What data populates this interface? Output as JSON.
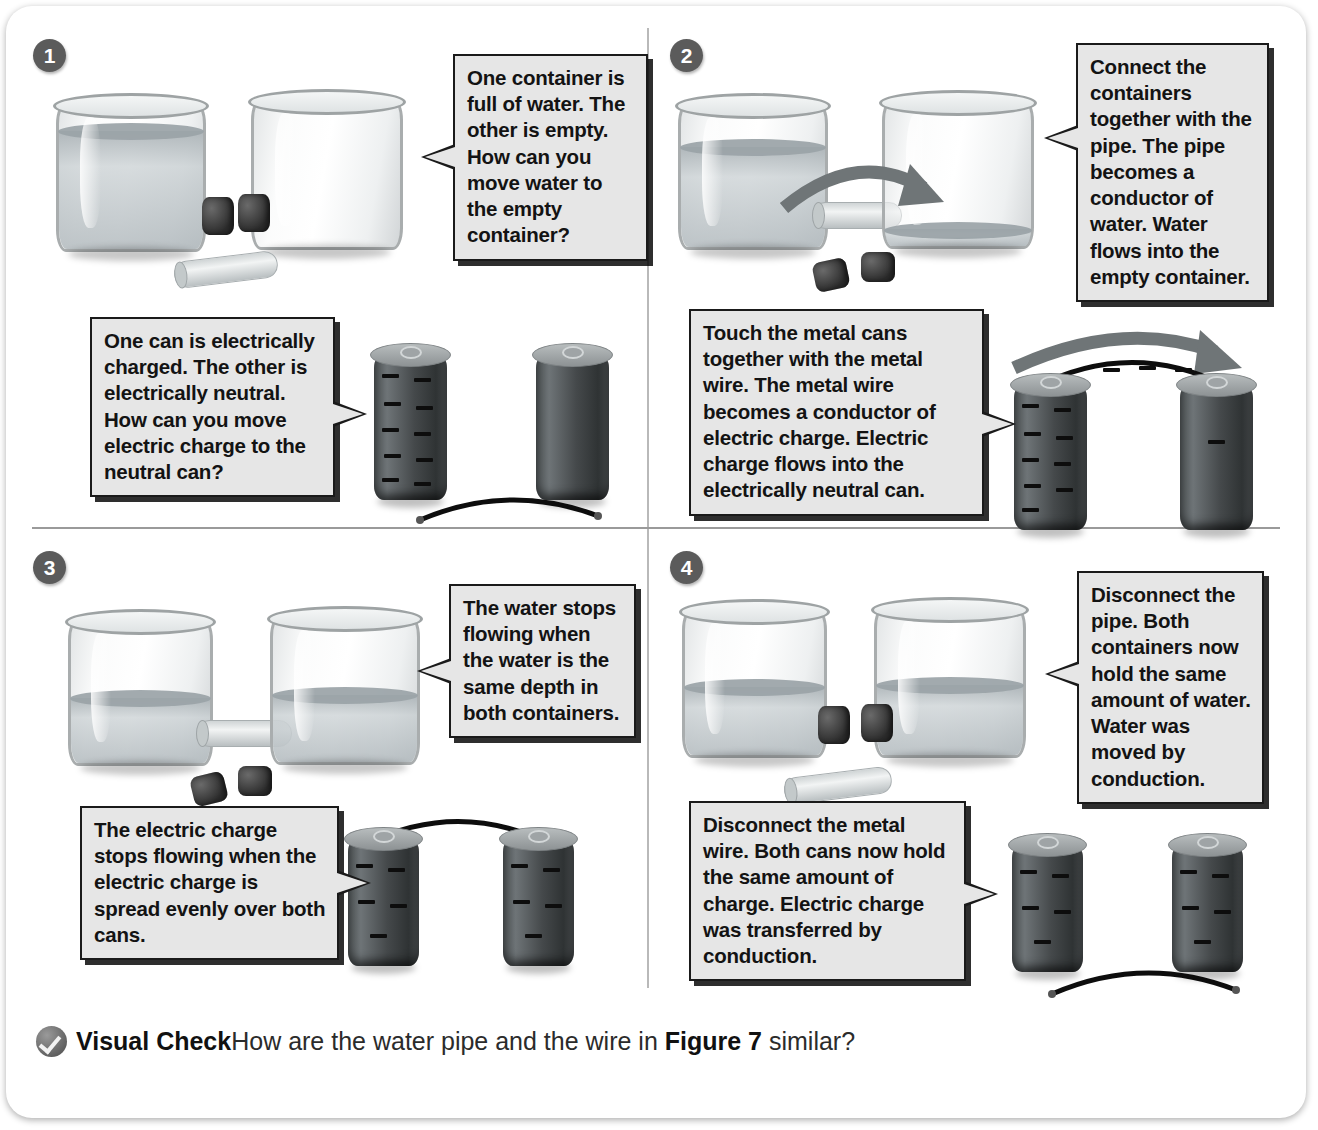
{
  "figure": {
    "panels": [
      {
        "number": "1",
        "water_callout": "One container is full of water. The other is empty. How can you move water to the empty container?",
        "charge_callout": "One can is electrically charged. The other is electrically neutral. How can you move electric charge to the neutral can?"
      },
      {
        "number": "2",
        "water_callout": "Connect the containers together with the pipe. The pipe becomes a conductor of water. Water flows into the empty container.",
        "charge_callout": "Touch the metal cans together with the metal wire. The metal wire becomes a conductor of electric charge. Electric charge flows into the electrically neutral can."
      },
      {
        "number": "3",
        "water_callout": "The water stops flowing when the water is the same depth in both containers.",
        "charge_callout": "The electric charge stops flowing when the electric charge is spread evenly over both cans."
      },
      {
        "number": "4",
        "water_callout": "Disconnect the pipe. Both containers now hold the same amount of water. Water was moved by conduction.",
        "charge_callout": "Disconnect the metal wire. Both cans now hold the same amount of charge. Electric charge was transferred by conduction."
      }
    ]
  },
  "footer": {
    "icon": "check-mark-icon",
    "label": "Visual Check",
    "question_part1": "How are the water pipe and the wire in ",
    "figure_ref": "Figure 7",
    "question_part2": " similar?"
  },
  "colors": {
    "card_background": "#ffffff",
    "callout_fill": "#e6e6e6",
    "callout_border": "#1a1a1a",
    "badge_fill": "#5b5b5b",
    "divider": "#b9b9b9",
    "can_body": "#45494b",
    "charge_mark": "#0d0d0d",
    "water": "#a8b0b4",
    "stopper": "#2b2b2b",
    "arrow": "#6f7577"
  }
}
